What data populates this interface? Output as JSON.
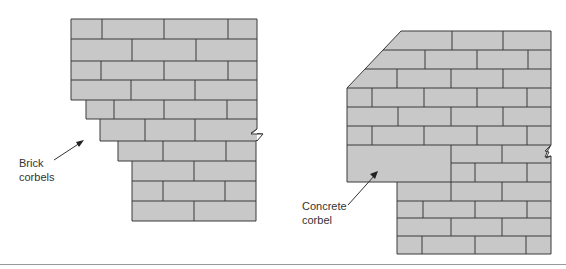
{
  "figure": {
    "type": "masonry-corbel-diagram",
    "colors": {
      "brick_fill": "#c8c8c8",
      "mortar_line": "#3a3a3a",
      "label_text": "#333333",
      "rule": "#9a9a9a"
    },
    "left_wall": {
      "label": "Brick\ncorbels",
      "description": "Brick wall with stepped brick corbels on left side"
    },
    "right_wall": {
      "label": "Concrete\ncorbel",
      "description": "Brick wall with a solid concrete corbel block"
    }
  }
}
